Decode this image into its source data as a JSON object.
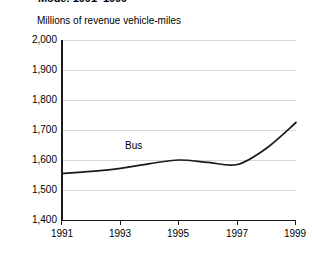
{
  "title": "Mode: 1991–1999",
  "caption": "Millions of revenue vehicle-miles",
  "series_label_bus": "Bus",
  "y_ticks": [
    "2,000",
    "1,900",
    "1,800",
    "1,700",
    "1,600",
    "1,500",
    "1,400"
  ],
  "x_ticks": [
    "1991",
    "1993",
    "1995",
    "1997",
    "1999"
  ],
  "colors": {
    "line": "#1a1a1a",
    "grid": "#d9d9d9",
    "axis": "#1a1a1a",
    "background": "#ffffff",
    "text": "#000000"
  },
  "chart_data": {
    "type": "line",
    "title": "Mode: 1991–1999",
    "subtitle": "Millions of revenue vehicle-miles",
    "xlabel": "",
    "ylabel": "Millions of revenue vehicle-miles",
    "x": [
      1991,
      1992,
      1993,
      1994,
      1995,
      1996,
      1997,
      1998,
      1999
    ],
    "xlim": [
      1991,
      1999
    ],
    "ylim": [
      1400,
      2000
    ],
    "ytick_values": [
      1400,
      1500,
      1600,
      1700,
      1800,
      1900,
      2000
    ],
    "xtick_values": [
      1991,
      1993,
      1995,
      1997,
      1999
    ],
    "grid": true,
    "legend": "inline-label",
    "series": [
      {
        "name": "Bus",
        "values": [
          1555,
          1562,
          1572,
          1588,
          1600,
          1592,
          1585,
          1640,
          1725
        ]
      }
    ]
  }
}
